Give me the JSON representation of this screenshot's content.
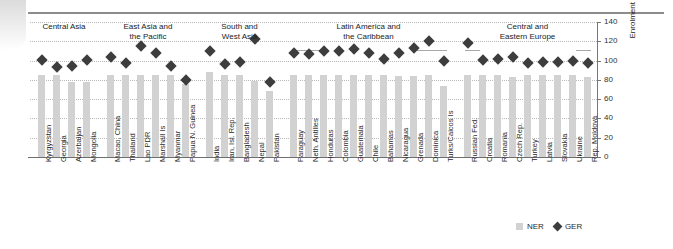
{
  "chart_data": {
    "type": "bar",
    "title": "",
    "xlabel": "",
    "ylabel": "Enrolment ratios (%)",
    "ylim": [
      0,
      140
    ],
    "yticks": [
      0,
      20,
      40,
      60,
      80,
      100,
      120,
      140
    ],
    "grid": true,
    "legend_position": "bottom-right",
    "categories": [
      "Kyrgyzstan",
      "Georgia",
      "Azerbaijan",
      "Mongolia",
      "Macao, China",
      "Thailand",
      "Lao PDR",
      "Marshall Is",
      "Myanmar",
      "Papua N. Guinea",
      "India",
      "Iran, Isl. Rep.",
      "Bangladesh",
      "Nepal",
      "Pakistan",
      "Paraguay",
      "Neth. Antilles",
      "Honduras",
      "Colombia",
      "Guatemala",
      "Chile",
      "Bahamas",
      "Nicaragua",
      "Grenada",
      "Dominica",
      "Turks/Caicos Is",
      "Russian Fed.",
      "Croatia",
      "Romania",
      "Czech Rep.",
      "Turkey",
      "Latvia",
      "Slovakia",
      "Ukraine",
      "Rep. Moldova"
    ],
    "series": [
      {
        "name": "NER",
        "type": "bar",
        "color": "#d2d2d2",
        "values": [
          85,
          85,
          78,
          78,
          85,
          85,
          85,
          85,
          85,
          76,
          88,
          85,
          85,
          79,
          68,
          85,
          85,
          85,
          85,
          85,
          85,
          85,
          84,
          84,
          85,
          74,
          85,
          85,
          85,
          83,
          85,
          85,
          85,
          85,
          83
        ]
      },
      {
        "name": "GER",
        "type": "scatter",
        "color": "#3d3d3d",
        "values": [
          101,
          93,
          94,
          101,
          104,
          97,
          115,
          108,
          94,
          80,
          110,
          96,
          99,
          122,
          78,
          108,
          107,
          110,
          110,
          112,
          108,
          102,
          108,
          113,
          120,
          100,
          118,
          101,
          102,
          104,
          97,
          99,
          99,
          100,
          97
        ]
      }
    ],
    "groups": [
      {
        "label": "Central Asia",
        "start": 0,
        "end": 3
      },
      {
        "label": "East Asia and\nthe Pacific",
        "start": 4,
        "end": 9
      },
      {
        "label": "South and\nWest Asia",
        "start": 10,
        "end": 14
      },
      {
        "label": "Latin America and\nthe Caribbean",
        "start": 15,
        "end": 25
      },
      {
        "label": "Central and\nEastern Europe",
        "start": 26,
        "end": 34
      }
    ]
  },
  "legend": {
    "ner_label": "NER",
    "ger_label": "GER"
  }
}
